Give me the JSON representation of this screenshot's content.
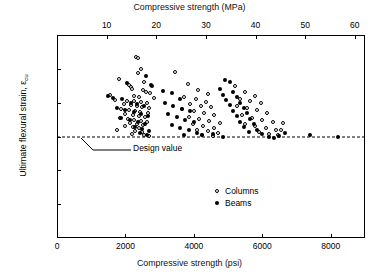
{
  "chart_data": {
    "type": "scatter",
    "title": "",
    "top_axis": {
      "label": "Compressive strength (MPa)",
      "ticks": [
        10,
        20,
        30,
        40,
        50,
        60
      ],
      "range": [
        0,
        62.05
      ]
    },
    "xlabel": "Compressive strength (psi)",
    "x_ticks": [
      0,
      2000,
      4000,
      6000,
      8000
    ],
    "xlim": [
      0,
      9000
    ],
    "ylabel": "Ultimate flexural strain, εcu",
    "ylabel_main": "Ultimate flexural strain, ",
    "ylabel_sub": "cu",
    "ylabel_eps": "ε",
    "y_ticks": [
      0,
      0.001,
      0.002,
      0.003,
      0.004,
      0.005,
      0.006
    ],
    "y_tick_labels": [
      "0",
      ".001",
      ".002",
      ".003",
      ".004",
      ".005",
      ".006"
    ],
    "ylim": [
      0,
      0.006
    ],
    "grid": false,
    "annotation": {
      "text": "Design value",
      "y_value": 0.003,
      "line_style": "dashed"
    },
    "legend": {
      "position": "inside-lower-right",
      "entries": [
        {
          "name": "Columns",
          "marker": "open-circle"
        },
        {
          "name": "Beams",
          "marker": "filled-circle"
        }
      ]
    },
    "series": [
      {
        "name": "Columns",
        "marker": "open-circle",
        "points": [
          [
            2300,
            0.00535
          ],
          [
            2370,
            0.00532
          ],
          [
            2450,
            0.005
          ],
          [
            2380,
            0.00487
          ],
          [
            1800,
            0.0047
          ],
          [
            2550,
            0.00462
          ],
          [
            2100,
            0.00452
          ],
          [
            2160,
            0.00445
          ],
          [
            2180,
            0.00441
          ],
          [
            2520,
            0.00436
          ],
          [
            2600,
            0.00432
          ],
          [
            2720,
            0.00428
          ],
          [
            1550,
            0.00424
          ],
          [
            2250,
            0.0042
          ],
          [
            2400,
            0.00418
          ],
          [
            2840,
            0.00415
          ],
          [
            1700,
            0.00408
          ],
          [
            2050,
            0.00406
          ],
          [
            2240,
            0.00404
          ],
          [
            2460,
            0.00402
          ],
          [
            2620,
            0.00399
          ],
          [
            1950,
            0.00396
          ],
          [
            2150,
            0.00393
          ],
          [
            2330,
            0.0039
          ],
          [
            2480,
            0.00387
          ],
          [
            2700,
            0.00385
          ],
          [
            1870,
            0.00382
          ],
          [
            2090,
            0.00379
          ],
          [
            2280,
            0.00376
          ],
          [
            2430,
            0.00373
          ],
          [
            2660,
            0.0037
          ],
          [
            1990,
            0.00367
          ],
          [
            2210,
            0.00364
          ],
          [
            2390,
            0.00361
          ],
          [
            2560,
            0.00358
          ],
          [
            1830,
            0.00355
          ],
          [
            2070,
            0.00352
          ],
          [
            2260,
            0.00349
          ],
          [
            2440,
            0.00346
          ],
          [
            2640,
            0.00343
          ],
          [
            2130,
            0.0034
          ],
          [
            2340,
            0.00337
          ],
          [
            2510,
            0.00334
          ],
          [
            2000,
            0.0033
          ],
          [
            2220,
            0.00327
          ],
          [
            2410,
            0.00324
          ],
          [
            1760,
            0.0032
          ],
          [
            2290,
            0.00317
          ],
          [
            2470,
            0.00313
          ],
          [
            2180,
            0.00308
          ],
          [
            2550,
            0.00305
          ],
          [
            2700,
            0.00302
          ],
          [
            3450,
            0.00492
          ],
          [
            3820,
            0.00455
          ],
          [
            4120,
            0.00437
          ],
          [
            4400,
            0.00425
          ],
          [
            3700,
            0.00418
          ],
          [
            4050,
            0.0041
          ],
          [
            4350,
            0.00403
          ],
          [
            3900,
            0.00397
          ],
          [
            4200,
            0.00391
          ],
          [
            4500,
            0.00386
          ],
          [
            3650,
            0.0038
          ],
          [
            4000,
            0.00374
          ],
          [
            4300,
            0.00369
          ],
          [
            4600,
            0.00363
          ],
          [
            3850,
            0.00358
          ],
          [
            4150,
            0.00352
          ],
          [
            4450,
            0.00347
          ],
          [
            4750,
            0.00341
          ],
          [
            3980,
            0.00336
          ],
          [
            4280,
            0.00331
          ],
          [
            4580,
            0.00326
          ],
          [
            4100,
            0.0032
          ],
          [
            4400,
            0.00315
          ],
          [
            4700,
            0.0031
          ],
          [
            4250,
            0.00305
          ],
          [
            4550,
            0.00302
          ],
          [
            5200,
            0.00448
          ],
          [
            5500,
            0.00432
          ],
          [
            5800,
            0.0042
          ],
          [
            5350,
            0.00412
          ],
          [
            5650,
            0.00405
          ],
          [
            5950,
            0.00398
          ],
          [
            5250,
            0.0039
          ],
          [
            5550,
            0.00383
          ],
          [
            5850,
            0.00377
          ],
          [
            6150,
            0.0037
          ],
          [
            5400,
            0.00363
          ],
          [
            5700,
            0.00356
          ],
          [
            6000,
            0.0035
          ],
          [
            6300,
            0.00344
          ],
          [
            5500,
            0.00338
          ],
          [
            5800,
            0.00332
          ],
          [
            6100,
            0.00326
          ],
          [
            6400,
            0.0032
          ],
          [
            5900,
            0.00313
          ],
          [
            6200,
            0.00307
          ],
          [
            6450,
            0.00303
          ],
          [
            6550,
            0.00318
          ],
          [
            6600,
            0.0034
          ]
        ]
      },
      {
        "name": "Beams",
        "marker": "filled-circle",
        "points": [
          [
            2600,
            0.0048
          ],
          [
            2050,
            0.00458
          ],
          [
            2750,
            0.00452
          ],
          [
            2790,
            0.00448
          ],
          [
            1480,
            0.0042
          ],
          [
            1640,
            0.00415
          ],
          [
            1900,
            0.0041
          ],
          [
            2150,
            0.004
          ],
          [
            2350,
            0.00395
          ],
          [
            2550,
            0.0039
          ],
          [
            1750,
            0.00384
          ],
          [
            2000,
            0.00378
          ],
          [
            2250,
            0.00372
          ],
          [
            2450,
            0.00366
          ],
          [
            2650,
            0.0036
          ],
          [
            1880,
            0.00354
          ],
          [
            2120,
            0.00348
          ],
          [
            2380,
            0.00342
          ],
          [
            2580,
            0.00336
          ],
          [
            2280,
            0.00328
          ],
          [
            2480,
            0.00322
          ],
          [
            2680,
            0.00316
          ],
          [
            2420,
            0.0031
          ],
          [
            2620,
            0.00304
          ],
          [
            3100,
            0.00435
          ],
          [
            3350,
            0.00428
          ],
          [
            3600,
            0.00412
          ],
          [
            3150,
            0.00398
          ],
          [
            3400,
            0.0039
          ],
          [
            3650,
            0.00382
          ],
          [
            3900,
            0.00374
          ],
          [
            3250,
            0.00366
          ],
          [
            3500,
            0.00358
          ],
          [
            3750,
            0.0035
          ],
          [
            4000,
            0.00342
          ],
          [
            3350,
            0.00334
          ],
          [
            3600,
            0.00326
          ],
          [
            3850,
            0.00318
          ],
          [
            4100,
            0.0031
          ],
          [
            3700,
            0.00304
          ],
          [
            4250,
            0.00303
          ],
          [
            4550,
            0.00308
          ],
          [
            4850,
            0.003
          ],
          [
            4900,
            0.00468
          ],
          [
            5050,
            0.00462
          ],
          [
            4750,
            0.0044
          ],
          [
            5150,
            0.00433
          ],
          [
            4850,
            0.00424
          ],
          [
            5250,
            0.00416
          ],
          [
            4950,
            0.00408
          ],
          [
            5350,
            0.004
          ],
          [
            5050,
            0.00392
          ],
          [
            5450,
            0.00384
          ],
          [
            5150,
            0.00376
          ],
          [
            5550,
            0.00368
          ],
          [
            5250,
            0.0036
          ],
          [
            5650,
            0.00352
          ],
          [
            5350,
            0.00344
          ],
          [
            5750,
            0.00336
          ],
          [
            5450,
            0.00328
          ],
          [
            5850,
            0.0032
          ],
          [
            5600,
            0.00312
          ],
          [
            6000,
            0.00306
          ],
          [
            6200,
            0.003
          ],
          [
            6350,
            0.00296
          ],
          [
            6500,
            0.00302
          ],
          [
            6650,
            0.0031
          ],
          [
            7400,
            0.00305
          ],
          [
            8200,
            0.00299
          ]
        ]
      }
    ]
  }
}
